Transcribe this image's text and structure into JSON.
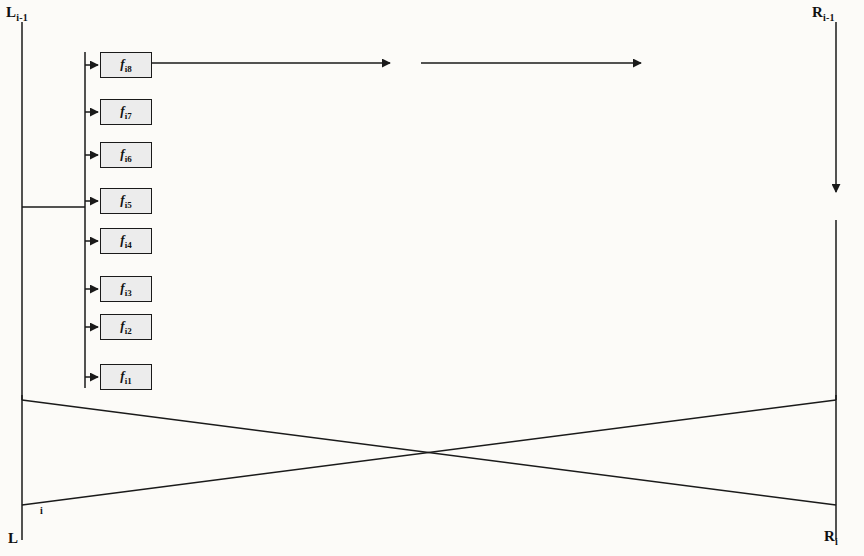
{
  "diagram": {
    "type": "block-diagram",
    "colors": {
      "line": "#1a1a1a",
      "box_fill": "#ececec",
      "xor_fill": "#e8e8e8",
      "background": "#fcfbf8"
    }
  },
  "labels": {
    "top_left": "L",
    "top_left_sub": "i-1",
    "top_right": "R",
    "top_right_sub": "i-1",
    "bottom_left": "L",
    "bottom_left_sub": "i",
    "bottom_right": "R",
    "bottom_right_sub": "i"
  },
  "function_blocks": [
    {
      "name": "f",
      "sub": "i8",
      "row": 8,
      "x": 100,
      "y": 52
    },
    {
      "name": "f",
      "sub": "i7",
      "row": 7,
      "x": 100,
      "y": 99
    },
    {
      "name": "f",
      "sub": "i6",
      "row": 6,
      "x": 100,
      "y": 142
    },
    {
      "name": "f",
      "sub": "i5",
      "row": 5,
      "x": 100,
      "y": 188
    },
    {
      "name": "f",
      "sub": "i4",
      "row": 4,
      "x": 100,
      "y": 228
    },
    {
      "name": "f",
      "sub": "i3",
      "row": 3,
      "x": 100,
      "y": 276
    },
    {
      "name": "f",
      "sub": "i2",
      "row": 2,
      "x": 100,
      "y": 314
    },
    {
      "name": "f",
      "sub": "i1",
      "row": 1,
      "x": 100,
      "y": 364
    }
  ],
  "rows_y": [
    377,
    328,
    290,
    241,
    203,
    153,
    105,
    63
  ],
  "xor_gates": [
    {
      "id": "x1a",
      "row": 1,
      "cx": 202,
      "cy": 379
    },
    {
      "id": "x1b",
      "row": 1,
      "cx": 433,
      "cy": 381
    },
    {
      "id": "x2a",
      "row": 2,
      "cx": 241,
      "cy": 328
    },
    {
      "id": "x2b",
      "row": 2,
      "cx": 466,
      "cy": 331
    },
    {
      "id": "x3a",
      "row": 3,
      "cx": 268,
      "cy": 290
    },
    {
      "id": "x3b",
      "row": 3,
      "cx": 494,
      "cy": 291
    },
    {
      "id": "x4a",
      "row": 4,
      "cx": 288,
      "cy": 241
    },
    {
      "id": "x4b",
      "row": 4,
      "cx": 523,
      "cy": 242
    },
    {
      "id": "x5a",
      "row": 5,
      "cx": 320,
      "cy": 203
    },
    {
      "id": "x5b",
      "row": 5,
      "cx": 549,
      "cy": 203
    },
    {
      "id": "x6a",
      "row": 6,
      "cx": 354,
      "cy": 152
    },
    {
      "id": "x6b",
      "row": 6,
      "cx": 596,
      "cy": 153
    },
    {
      "id": "x7a",
      "row": 7,
      "cx": 385,
      "cy": 104
    },
    {
      "id": "x7b",
      "row": 7,
      "cx": 625,
      "cy": 105
    },
    {
      "id": "x8a",
      "row": 8,
      "cx": 406,
      "cy": 62
    },
    {
      "id": "x8b",
      "row": 8,
      "cx": 657,
      "cy": 62
    },
    {
      "id": "xout",
      "row": 0,
      "cx": 836,
      "cy": 207
    }
  ],
  "crossbar": {
    "left_x": 695,
    "right_x": 770,
    "inputs": 8,
    "outputs": 8,
    "description": "8-line crossover permutation merging into output bus"
  },
  "geometry": {
    "input_bus_x": 22,
    "fanout_x": 85,
    "fanout_y": 207,
    "output_bus_x": 836,
    "frame_top": 20,
    "frame_bottom": 505,
    "cross_top_y": 400,
    "cross_bottom_y": 505
  }
}
